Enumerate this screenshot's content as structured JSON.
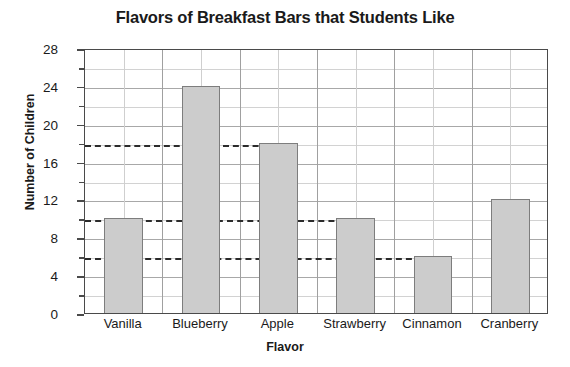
{
  "chart_data": {
    "type": "bar",
    "title": "Flavors of Breakfast Bars that Students Like",
    "xlabel": "Flavor",
    "ylabel": "Number of Children",
    "categories": [
      "Vanilla",
      "Blueberry",
      "Apple",
      "Strawberry",
      "Cinnamon",
      "Cranberry"
    ],
    "values": [
      10,
      24,
      18,
      10,
      6,
      12
    ],
    "ylim": [
      0,
      28
    ],
    "ytick_labels": [
      "0",
      "4",
      "8",
      "12",
      "16",
      "20",
      "24",
      "28"
    ],
    "ytick_values": [
      0,
      4,
      8,
      12,
      16,
      20,
      24,
      28
    ],
    "yminor_tick_values": [
      2,
      6,
      10,
      14,
      18,
      22,
      26
    ],
    "reference_lines": [
      {
        "value": 18,
        "style": "dashed",
        "extends_to_category": "Apple"
      },
      {
        "value": 10,
        "style": "dashed",
        "extends_to_category": "Strawberry"
      },
      {
        "value": 6,
        "style": "dashed",
        "extends_to_category": "Cinnamon"
      }
    ],
    "grid": "horizontal-and-vertical",
    "legend": "none",
    "bar_fill_color": "#cccccc",
    "bar_border_color": "#7d7d7d",
    "grid_color": "#b4b4b4",
    "axis_color": "#4a4a4a",
    "text_color": "#1a1a1a"
  }
}
